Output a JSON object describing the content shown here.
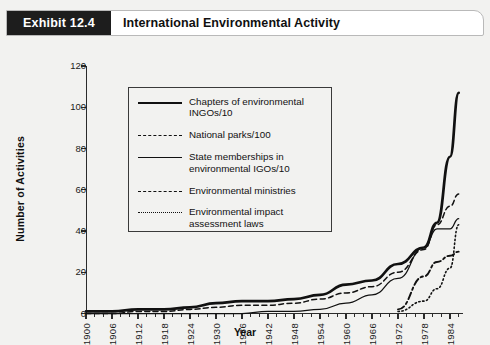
{
  "header": {
    "tag": "Exhibit 12.4",
    "title": "International Environmental Activity"
  },
  "chart_data": {
    "type": "line",
    "title": "International Environmental Activity",
    "xlabel": "Year",
    "ylabel": "Number of Activities",
    "xlim": [
      1900,
      1987
    ],
    "ylim": [
      0,
      120
    ],
    "yticks": [
      0,
      20,
      40,
      60,
      80,
      100,
      120
    ],
    "xticks": [
      1900,
      1906,
      1912,
      1918,
      1924,
      1930,
      1936,
      1942,
      1948,
      1954,
      1960,
      1966,
      1972,
      1978,
      1984
    ],
    "grid": false,
    "legend_position": "upper-left-inside",
    "x": [
      1900,
      1906,
      1912,
      1918,
      1924,
      1930,
      1936,
      1942,
      1948,
      1954,
      1960,
      1966,
      1972,
      1978,
      1981,
      1984,
      1986
    ],
    "series": [
      {
        "name": "Chapters of environmental INGOs/10",
        "style": "solid-thick",
        "values": [
          1,
          1,
          2,
          2,
          3,
          5,
          6,
          6,
          7,
          9,
          14,
          16,
          24,
          32,
          44,
          76,
          107
        ]
      },
      {
        "name": "National parks/100",
        "style": "dashed",
        "values": [
          0,
          0,
          1,
          1,
          2,
          3,
          4,
          4,
          5,
          7,
          10,
          13,
          20,
          31,
          43,
          52,
          58
        ]
      },
      {
        "name": "State memberships in environmental IGOs/10",
        "style": "solid-thin",
        "values": [
          0,
          0,
          0,
          0,
          0,
          0,
          0,
          1,
          1,
          2,
          5,
          9,
          17,
          32,
          41,
          41,
          46
        ]
      },
      {
        "name": "Environmental ministries",
        "style": "dash-dot",
        "values": [
          null,
          null,
          null,
          null,
          null,
          null,
          null,
          null,
          null,
          null,
          null,
          null,
          2,
          18,
          25,
          28,
          30
        ]
      },
      {
        "name": "Environmental impact assessment laws",
        "style": "dotted",
        "values": [
          null,
          null,
          null,
          null,
          null,
          null,
          null,
          null,
          null,
          null,
          null,
          null,
          1,
          6,
          12,
          22,
          43
        ]
      }
    ]
  },
  "legend": {
    "items": [
      {
        "label": "Chapters of environmental\nINGOs/10",
        "style": "solid-thick"
      },
      {
        "label": "National parks/100",
        "style": "dashed"
      },
      {
        "label": "State memberships in\nenvironmental IGOs/10",
        "style": "solid-thin"
      },
      {
        "label": "Environmental ministries",
        "style": "dash-dot"
      },
      {
        "label": "Environmental impact\nassessment laws",
        "style": "dotted"
      }
    ]
  },
  "colors": {
    "ink": "#111111",
    "page_background": "#f2f2f0",
    "header_tag_background": "#1d1d1d",
    "header_background": "#ffffff"
  }
}
